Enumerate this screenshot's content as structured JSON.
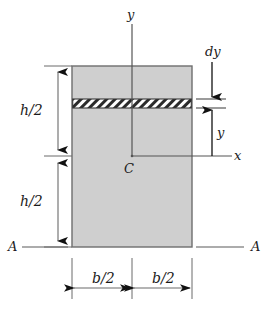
{
  "figure": {
    "type": "engineering-diagram",
    "background_color": "#ffffff",
    "section_fill_color": "#cfcfcf",
    "section_stroke_color": "#6e6e6e",
    "hatch_color": "#2b2b2b",
    "line_color": "#3a3a3a",
    "text_color": "#1b1b1b",
    "labels": {
      "axis_y": "y",
      "axis_x": "x",
      "centroid": "C",
      "strip_thickness": "dy",
      "strip_distance": "y",
      "height_upper": "h/2",
      "height_lower": "h/2",
      "width_left": "b/2",
      "width_right": "b/2",
      "section_left": "A",
      "section_right": "A"
    },
    "geometry": {
      "rect_left": 72,
      "rect_right": 192,
      "rect_top": 66,
      "rect_bottom": 247,
      "centroid_x": 132,
      "neutral_axis_y": 156,
      "strip_top": 99,
      "strip_bottom": 108,
      "dim_line_x": 58,
      "dim_line_right_x": 212,
      "bottom_dim_y": 288
    }
  }
}
